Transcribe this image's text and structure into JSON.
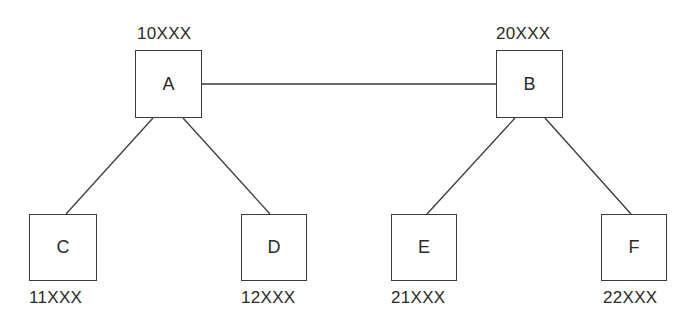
{
  "diagram": {
    "type": "hierarchy",
    "nodes": [
      {
        "id": "A",
        "label": "A",
        "code": "10XXX",
        "box": [
          135,
          50,
          67,
          68
        ],
        "code_pos": "above",
        "code_xy": [
          137,
          24
        ]
      },
      {
        "id": "B",
        "label": "B",
        "code": "20XXX",
        "box": [
          496,
          50,
          67,
          68
        ],
        "code_pos": "above",
        "code_xy": [
          496,
          24
        ]
      },
      {
        "id": "C",
        "label": "C",
        "code": "11XXX",
        "box": [
          29,
          214,
          68,
          67
        ],
        "code_pos": "below",
        "code_xy": [
          29,
          288
        ]
      },
      {
        "id": "D",
        "label": "D",
        "code": "12XXX",
        "box": [
          241,
          214,
          66,
          67
        ],
        "code_pos": "below",
        "code_xy": [
          241,
          288
        ]
      },
      {
        "id": "E",
        "label": "E",
        "code": "21XXX",
        "box": [
          391,
          214,
          66,
          67
        ],
        "code_pos": "below",
        "code_xy": [
          391,
          288
        ]
      },
      {
        "id": "F",
        "label": "F",
        "code": "22XXX",
        "box": [
          601,
          214,
          66,
          67
        ],
        "code_pos": "below",
        "code_xy": [
          603,
          288
        ]
      }
    ],
    "edges": [
      {
        "from": "A",
        "to": "B",
        "line": [
          202,
          84,
          496,
          84
        ]
      },
      {
        "from": "A",
        "to": "C",
        "line": [
          153,
          118,
          66,
          214
        ]
      },
      {
        "from": "A",
        "to": "D",
        "line": [
          183,
          118,
          270,
          214
        ]
      },
      {
        "from": "B",
        "to": "E",
        "line": [
          515,
          118,
          427,
          214
        ]
      },
      {
        "from": "B",
        "to": "F",
        "line": [
          545,
          118,
          631,
          214
        ]
      }
    ],
    "colors": {
      "stroke": "#3a3a3a",
      "text": "#2a2a2a",
      "background": "#ffffff"
    }
  }
}
